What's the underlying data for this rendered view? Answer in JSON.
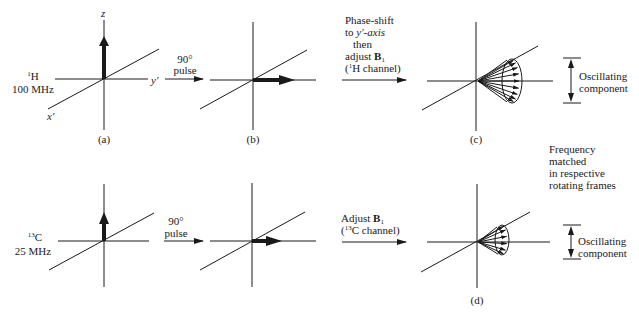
{
  "rows": [
    {
      "nucleus_sup": "1",
      "nucleus": "H",
      "frequency": "100 MHz",
      "pulse_step": {
        "angle": "90°",
        "label": "pulse"
      },
      "transfer_step": {
        "lines": [
          "Phase-shift",
          "to",
          "y′-axis",
          "then",
          "adjust",
          "B",
          "1",
          "H channel"
        ]
      },
      "oscillating_label": [
        "Oscillating",
        "component"
      ]
    },
    {
      "nucleus_sup": "13",
      "nucleus": "C",
      "frequency": "25 MHz",
      "pulse_step": {
        "angle": "90°",
        "label": "pulse"
      },
      "transfer_step": {
        "adjust": "Adjust",
        "b": "B",
        "b_sub": "1",
        "channel_sup": "13",
        "channel": "C channel)"
      },
      "oscillating_label": [
        "Oscillating",
        "component"
      ]
    }
  ],
  "axes": {
    "z": "z",
    "y": "y′",
    "x": "x′"
  },
  "panel_labels": [
    "(a)",
    "(b)",
    "(c)",
    "(d)"
  ],
  "frequency_note": [
    "Frequency",
    "matched",
    "in respective",
    "rotating frames"
  ],
  "colors": {
    "ink": "#1a1a1a",
    "background": "#ffffff"
  }
}
